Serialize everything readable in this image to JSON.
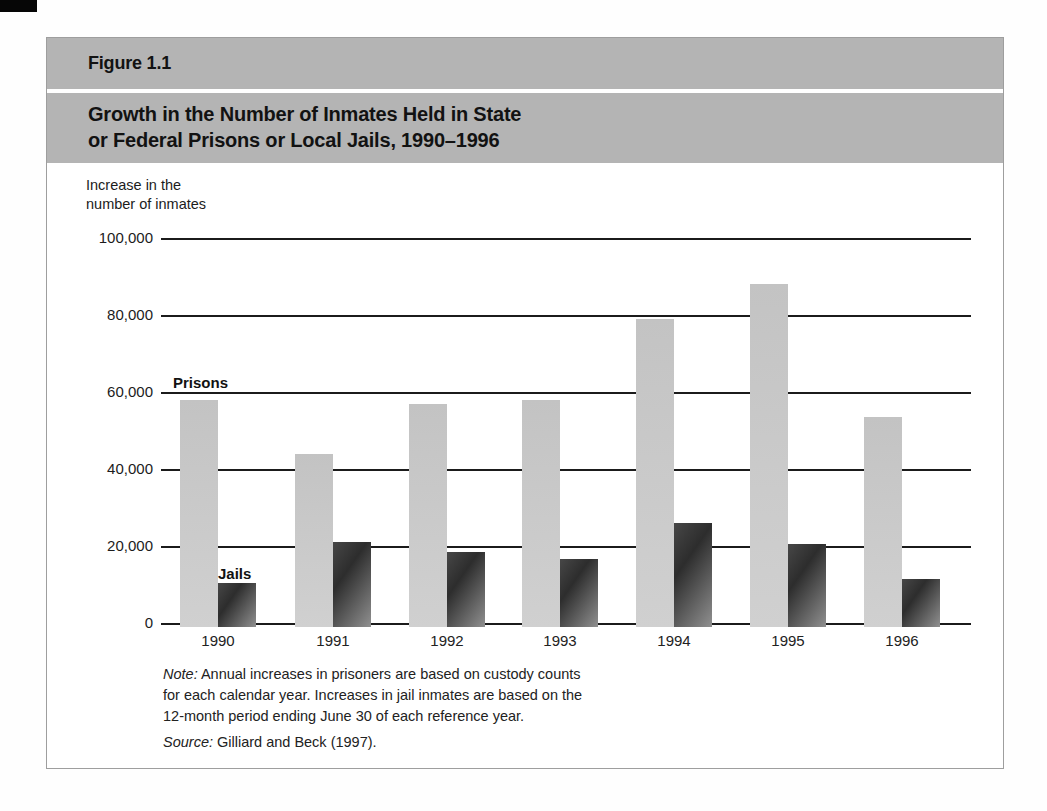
{
  "figure": {
    "label": "Figure 1.1",
    "title": "Growth in the Number of Inmates Held in State\nor Federal Prisons or Local Jails, 1990–1996"
  },
  "chart_data": {
    "type": "bar",
    "title": "Growth in the Number of Inmates Held in State or Federal Prisons or Local Jails, 1990–1996",
    "ylabel": "Increase in the\nnumber of inmates",
    "xlabel": "",
    "categories": [
      "1990",
      "1991",
      "1992",
      "1993",
      "1994",
      "1995",
      "1996"
    ],
    "series": [
      {
        "name": "Prisons",
        "color": "#c8c8c8",
        "values": [
          58000,
          44000,
          57000,
          58000,
          79000,
          88000,
          53500
        ]
      },
      {
        "name": "Jails",
        "color": "#3a3a3a",
        "values": [
          10500,
          21000,
          18500,
          16500,
          26000,
          20500,
          11500
        ]
      }
    ],
    "ylim": [
      0,
      100000
    ],
    "yticks": [
      {
        "value": 100000,
        "label": "100,000"
      },
      {
        "value": 80000,
        "label": "80,000"
      },
      {
        "value": 60000,
        "label": "60,000"
      },
      {
        "value": 40000,
        "label": "40,000"
      },
      {
        "value": 20000,
        "label": "20,000"
      },
      {
        "value": 0,
        "label": "0"
      }
    ],
    "grid": "horizontal",
    "legend_position": "inline-labels"
  },
  "notes": {
    "note_label": "Note:",
    "note_text": " Annual increases in prisoners are based on custody counts\nfor each calendar year. Increases in jail inmates are based on the\n12-month period ending June 30 of each reference year.",
    "source_label": "Source:",
    "source_text": " Gilliard and Beck (1997)."
  },
  "colors": {
    "header_band": "#b4b4b4",
    "prison_bar": "#c8c8c8",
    "jail_bar_dark": "#2d2d2d",
    "jail_bar_light": "#909090",
    "gridline": "#1b1b1b",
    "box_border": "#9e9e9e"
  }
}
